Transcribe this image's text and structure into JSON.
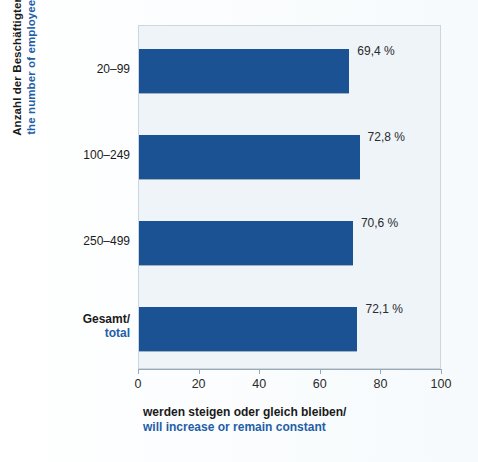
{
  "chart_data": {
    "type": "bar",
    "orientation": "horizontal",
    "title": "",
    "subtitle": "",
    "categories": [
      "20–99",
      "100–249",
      "250–499",
      "Gesamt/\ntotal"
    ],
    "category_labels": [
      {
        "de": "20–99",
        "en": "",
        "bold": false
      },
      {
        "de": "100–249",
        "en": "",
        "bold": false
      },
      {
        "de": "250–499",
        "en": "",
        "bold": false
      },
      {
        "de": "Gesamt/",
        "en": "total",
        "bold": true
      }
    ],
    "values": [
      69.4,
      72.8,
      70.6,
      72.1
    ],
    "value_labels": [
      "69,4 %",
      "72,8 %",
      "70,6 %",
      "72,1 %"
    ],
    "xlabel_de": "werden steigen oder gleich bleiben/",
    "xlabel_en": "will increase or remain constant",
    "ylabel_de": "Anzahl der Beschäftigten/",
    "ylabel_en": "the number of employees",
    "xlim": [
      0,
      100
    ],
    "xticks": [
      0,
      20,
      40,
      60,
      80,
      100
    ],
    "xtick_labels": [
      "0",
      "20",
      "40",
      "60",
      "80",
      "100"
    ],
    "grid": false,
    "legend": "none",
    "bar_color": "#1a5293",
    "plot_background": "#eff4f9",
    "accent_color": "#1f5ea8"
  }
}
